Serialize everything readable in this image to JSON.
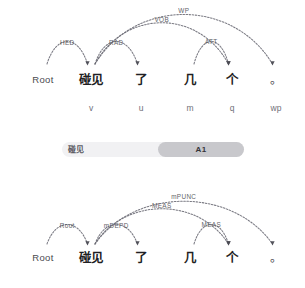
{
  "top_parse": {
    "name": "syntactic-dependency-parse",
    "tokens": [
      {
        "text": "Root",
        "pos": "",
        "x": 43
      },
      {
        "text": "碰见",
        "pos": "v",
        "x": 91
      },
      {
        "text": "了",
        "pos": "u",
        "x": 141
      },
      {
        "text": "几",
        "pos": "m",
        "x": 190
      },
      {
        "text": "个",
        "pos": "q",
        "x": 232
      },
      {
        "text": "。",
        "pos": "wp",
        "x": 276
      }
    ],
    "arcs": [
      {
        "label": "HED",
        "from": 0,
        "to": 1,
        "height": 30,
        "label_y": 45
      },
      {
        "label": "RAD",
        "from": 1,
        "to": 2,
        "height": 30,
        "label_y": 45
      },
      {
        "label": "ATT",
        "from": 3,
        "to": 4,
        "height": 30,
        "label_y": 44
      },
      {
        "label": "VOB",
        "from": 1,
        "to": 4,
        "height": 55,
        "label_y": 22
      },
      {
        "label": "WP",
        "from": 1,
        "to": 5,
        "height": 66,
        "label_y": 13
      }
    ]
  },
  "role_bar": {
    "name": "semantic-role-bar",
    "predicate_label": "碰见",
    "role_label": "A1"
  },
  "bottom_parse": {
    "name": "semantic-dependency-parse",
    "tokens": [
      {
        "text": "Root",
        "x": 43
      },
      {
        "text": "碰见",
        "x": 91
      },
      {
        "text": "了",
        "x": 141
      },
      {
        "text": "几",
        "x": 190
      },
      {
        "text": "个",
        "x": 232
      },
      {
        "text": "。",
        "x": 276
      }
    ],
    "arcs": [
      {
        "label": "Root",
        "from": 0,
        "to": 1,
        "height": 26,
        "label_y": 42
      },
      {
        "label": "mDEPD",
        "from": 1,
        "to": 2,
        "height": 26,
        "label_y": 42
      },
      {
        "label": "MEAS",
        "from": 3,
        "to": 4,
        "height": 26,
        "label_y": 41
      },
      {
        "label": "MEAS",
        "from": 1,
        "to": 4,
        "height": 47,
        "label_y": 22
      },
      {
        "label": "mPUNC",
        "from": 1,
        "to": 5,
        "height": 57,
        "label_y": 13
      }
    ]
  },
  "colors": {
    "arc_stroke": "#6f6f78",
    "arc_label": "#5a5a62",
    "token_text": "#1f1f24",
    "bar_track": "#f1f1f3",
    "bar_chip": "#c8c8cc"
  }
}
